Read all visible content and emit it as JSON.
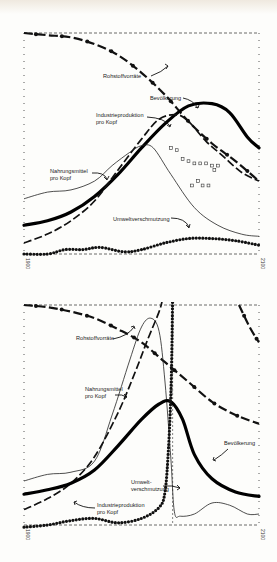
{
  "chart_data": [
    {
      "type": "line",
      "title": "",
      "xlabel": "",
      "ylabel": "",
      "x_range": [
        1900,
        2100
      ],
      "tick_labels": [
        "1900",
        "2100"
      ],
      "grid": false,
      "legend": "inline annotations with arrows",
      "series": [
        {
          "name": "Rohstoffvorräte",
          "style": "dash-dot-heavy",
          "points": [
            [
              1900,
              1.0
            ],
            [
              1920,
              0.99
            ],
            [
              1940,
              0.98
            ],
            [
              1960,
              0.95
            ],
            [
              1980,
              0.9
            ],
            [
              2000,
              0.82
            ],
            [
              2020,
              0.72
            ],
            [
              2040,
              0.6
            ],
            [
              2060,
              0.5
            ],
            [
              2080,
              0.42
            ],
            [
              2100,
              0.33
            ]
          ]
        },
        {
          "name": "Bevölkerung",
          "style": "thick-solid",
          "points": [
            [
              1900,
              0.13
            ],
            [
              1920,
              0.15
            ],
            [
              1940,
              0.19
            ],
            [
              1960,
              0.26
            ],
            [
              1980,
              0.36
            ],
            [
              2000,
              0.48
            ],
            [
              2020,
              0.59
            ],
            [
              2040,
              0.67
            ],
            [
              2060,
              0.68
            ],
            [
              2075,
              0.64
            ],
            [
              2090,
              0.53
            ],
            [
              2100,
              0.48
            ]
          ]
        },
        {
          "name": "Industrieproduktion pro Kopf",
          "style": "long-dash",
          "points": [
            [
              1900,
              0.05
            ],
            [
              1920,
              0.09
            ],
            [
              1940,
              0.15
            ],
            [
              1960,
              0.24
            ],
            [
              1980,
              0.38
            ],
            [
              2000,
              0.52
            ],
            [
              2015,
              0.61
            ],
            [
              2030,
              0.63
            ],
            [
              2040,
              0.6
            ],
            [
              2055,
              0.51
            ],
            [
              2070,
              0.44
            ],
            [
              2085,
              0.37
            ],
            [
              2100,
              0.33
            ]
          ]
        },
        {
          "name": "Nahrungsmittel pro Kopf",
          "style": "thin-solid",
          "points": [
            [
              1900,
              0.25
            ],
            [
              1920,
              0.28
            ],
            [
              1940,
              0.29
            ],
            [
              1960,
              0.33
            ],
            [
              1975,
              0.4
            ],
            [
              1990,
              0.46
            ],
            [
              2000,
              0.49
            ],
            [
              2010,
              0.48
            ],
            [
              2025,
              0.36
            ],
            [
              2045,
              0.21
            ],
            [
              2065,
              0.13
            ],
            [
              2085,
              0.09
            ],
            [
              2100,
              0.08
            ]
          ]
        },
        {
          "name": "Umweltverschmutzung",
          "style": "dotted-heavy",
          "points": [
            [
              1900,
              0.0
            ],
            [
              1920,
              0.0
            ],
            [
              1935,
              0.02
            ],
            [
              1950,
              0.02
            ],
            [
              1965,
              0.03
            ],
            [
              1985,
              0.01
            ],
            [
              2000,
              0.02
            ],
            [
              2020,
              0.05
            ],
            [
              2040,
              0.07
            ],
            [
              2060,
              0.07
            ],
            [
              2080,
              0.06
            ],
            [
              2100,
              0.04
            ]
          ]
        },
        {
          "name": "",
          "style": "open-squares",
          "points": [
            [
              2025,
              0.48
            ],
            [
              2030,
              0.47
            ],
            [
              2035,
              0.43
            ],
            [
              2040,
              0.42
            ],
            [
              2045,
              0.41
            ],
            [
              2050,
              0.41
            ],
            [
              2055,
              0.41
            ],
            [
              2060,
              0.4
            ],
            [
              2065,
              0.4
            ],
            [
              2062,
              0.38
            ],
            [
              2048,
              0.33
            ],
            [
              2043,
              0.31
            ],
            [
              2052,
              0.31
            ],
            [
              2057,
              0.31
            ]
          ]
        }
      ]
    },
    {
      "type": "line",
      "title": "",
      "xlabel": "",
      "ylabel": "",
      "x_range": [
        1900,
        2100
      ],
      "tick_labels": [
        "1900",
        "2100"
      ],
      "grid": false,
      "legend": "inline annotations with arrows",
      "series": [
        {
          "name": "Rohstoffvorräte",
          "style": "dash-dot-heavy",
          "points": [
            [
              1900,
              1.0
            ],
            [
              1920,
              0.99
            ],
            [
              1940,
              0.97
            ],
            [
              1960,
              0.94
            ],
            [
              1980,
              0.89
            ],
            [
              2000,
              0.83
            ],
            [
              2020,
              0.74
            ],
            [
              2040,
              0.65
            ],
            [
              2060,
              0.56
            ],
            [
              2080,
              0.5
            ],
            [
              2100,
              0.46
            ]
          ]
        },
        {
          "name": "Rohstoffvorräte (restored)",
          "style": "dash-dot-heavy",
          "points": [
            [
              2083,
              1.0
            ],
            [
              2092,
              0.9
            ],
            [
              2100,
              0.83
            ]
          ]
        },
        {
          "name": "Nahrungsmittel pro Kopf",
          "style": "thin-solid",
          "points": [
            [
              1900,
              0.2
            ],
            [
              1920,
              0.23
            ],
            [
              1940,
              0.24
            ],
            [
              1960,
              0.29
            ],
            [
              1975,
              0.5
            ],
            [
              1990,
              0.75
            ],
            [
              2000,
              0.9
            ],
            [
              2008,
              0.94
            ],
            [
              2015,
              0.88
            ],
            [
              2020,
              0.65
            ],
            [
              2025,
              0.3
            ],
            [
              2028,
              0.06
            ],
            [
              2033,
              0.04
            ],
            [
              2045,
              0.05
            ],
            [
              2060,
              0.1
            ],
            [
              2075,
              0.09
            ],
            [
              2090,
              0.05
            ],
            [
              2100,
              0.05
            ]
          ]
        },
        {
          "name": "Industrieproduktion pro Kopf",
          "style": "long-dash",
          "points": [
            [
              1900,
              0.07
            ],
            [
              1920,
              0.12
            ],
            [
              1940,
              0.19
            ],
            [
              1960,
              0.31
            ],
            [
              1980,
              0.51
            ],
            [
              1995,
              0.7
            ],
            [
              2005,
              0.84
            ],
            [
              2015,
              0.97
            ],
            [
              2018,
              1.03
            ]
          ]
        },
        {
          "name": "Bevölkerung",
          "style": "thick-solid",
          "points": [
            [
              1900,
              0.14
            ],
            [
              1920,
              0.16
            ],
            [
              1940,
              0.19
            ],
            [
              1960,
              0.25
            ],
            [
              1980,
              0.36
            ],
            [
              2000,
              0.48
            ],
            [
              2015,
              0.55
            ],
            [
              2025,
              0.56
            ],
            [
              2035,
              0.48
            ],
            [
              2045,
              0.32
            ],
            [
              2060,
              0.21
            ],
            [
              2080,
              0.15
            ],
            [
              2100,
              0.13
            ]
          ]
        },
        {
          "name": "Umweltverschmutzung",
          "style": "dotted-heavy",
          "points": [
            [
              1900,
              -0.01
            ],
            [
              1920,
              0.0
            ],
            [
              1940,
              0.02
            ],
            [
              1960,
              0.03
            ],
            [
              1980,
              0.01
            ],
            [
              2000,
              0.03
            ],
            [
              2015,
              0.08
            ],
            [
              2020,
              0.15
            ],
            [
              2023,
              0.35
            ],
            [
              2025,
              0.6
            ],
            [
              2026,
              0.85
            ],
            [
              2026.5,
              1.03
            ]
          ]
        }
      ]
    }
  ],
  "charts": [
    {
      "labels": [
        {
          "text": "Rohstoffvorräte",
          "x": 103,
          "y": 78
        },
        {
          "text": "Bevölkerung",
          "x": 150,
          "y": 100
        },
        {
          "text": "Industrieproduktion",
          "x": 96,
          "y": 117
        },
        {
          "text": "pro Kopf",
          "x": 96,
          "y": 124
        },
        {
          "text": "Nahrungsmittel",
          "x": 50,
          "y": 173
        },
        {
          "text": "pro Kopf",
          "x": 50,
          "y": 180
        },
        {
          "text": "Umweltverschmutzung",
          "x": 113,
          "y": 221
        }
      ],
      "tick_left": "1900",
      "tick_right": "2100"
    },
    {
      "labels": [
        {
          "text": "Rohstoffvorräte",
          "x": 76,
          "y": 340
        },
        {
          "text": "Nahrungsmittel",
          "x": 85,
          "y": 391
        },
        {
          "text": "pro Kopf",
          "x": 85,
          "y": 398
        },
        {
          "text": "Bevölkerung",
          "x": 224,
          "y": 445
        },
        {
          "text": "Umwelt-",
          "x": 131,
          "y": 484
        },
        {
          "text": "verschmutzung",
          "x": 131,
          "y": 491
        },
        {
          "text": "Industrieproduktion",
          "x": 97,
          "y": 507
        },
        {
          "text": "pro Kopf",
          "x": 97,
          "y": 514
        }
      ],
      "tick_left": "1900",
      "tick_right": "2100"
    }
  ]
}
